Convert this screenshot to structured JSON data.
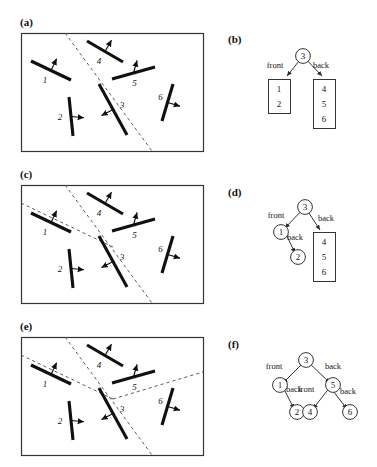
{
  "figure": {
    "type": "bsp-tree-construction-diagram",
    "panels": [
      {
        "id": "a",
        "label": "(a)",
        "kind": "scene",
        "x": 20,
        "y": 16
      },
      {
        "id": "b",
        "label": "(b)",
        "kind": "tree",
        "x": 228,
        "y": 33
      },
      {
        "id": "c",
        "label": "(c)",
        "kind": "scene",
        "x": 20,
        "y": 168
      },
      {
        "id": "d",
        "label": "(d)",
        "kind": "tree",
        "x": 228,
        "y": 186
      },
      {
        "id": "e",
        "label": "(e)",
        "kind": "scene",
        "x": 20,
        "y": 320
      },
      {
        "id": "f",
        "label": "(f)",
        "kind": "tree",
        "x": 228,
        "y": 338
      }
    ]
  },
  "scene": {
    "segment_labels": [
      "1",
      "2",
      "3",
      "4",
      "5",
      "6"
    ],
    "segments": [
      {
        "label": "1",
        "x1": 31,
        "y1": 61,
        "x2": 71,
        "y2": 80,
        "nx": 0.43,
        "ny": -0.9,
        "label_dx": -6,
        "label_dy": 12
      },
      {
        "label": "2",
        "x1": 69,
        "y1": 97,
        "x2": 73,
        "y2": 136,
        "nx": 0.99,
        "ny": 0.1,
        "label_dx": -11,
        "label_dy": 3
      },
      {
        "label": "3",
        "x1": 99,
        "y1": 84,
        "x2": 127,
        "y2": 135,
        "nx": -0.88,
        "ny": 0.47,
        "label_dx": 9,
        "label_dy": -2
      },
      {
        "label": "4",
        "x1": 87,
        "y1": 41,
        "x2": 123,
        "y2": 62,
        "nx": 0.5,
        "ny": -0.86,
        "label_dx": -6,
        "label_dy": 12
      },
      {
        "label": "5",
        "x1": 112,
        "y1": 79,
        "x2": 155,
        "y2": 67,
        "nx": 0.27,
        "ny": -0.96,
        "label_dx": 1,
        "label_dy": 13
      },
      {
        "label": "6",
        "x1": 173,
        "y1": 84,
        "x2": 162,
        "y2": 121,
        "nx": 0.96,
        "ny": 0.28,
        "label_dx": -7,
        "label_dy": -3
      }
    ],
    "box": {
      "x": 21,
      "y": 33,
      "w": 182,
      "h": 118
    },
    "splits": {
      "a": [
        "3"
      ],
      "c": [
        "3",
        "1"
      ],
      "e": [
        "3",
        "1",
        "5"
      ]
    },
    "dashed_lines": {
      "a": [
        {
          "x1": 65,
          "y1": 33,
          "x2": 152,
          "y2": 151
        }
      ],
      "c": [
        {
          "x1": 65,
          "y1": 33,
          "x2": 152,
          "y2": 151
        },
        {
          "x1": 21,
          "y1": 51,
          "x2": 113,
          "y2": 95
        }
      ],
      "e": [
        {
          "x1": 65,
          "y1": 33,
          "x2": 152,
          "y2": 151
        },
        {
          "x1": 21,
          "y1": 51,
          "x2": 113,
          "y2": 95
        },
        {
          "x1": 113,
          "y1": 95,
          "x2": 203,
          "y2": 68
        }
      ]
    }
  },
  "trees": {
    "b": {
      "root": {
        "value": "3",
        "cx": 303,
        "cy": 56,
        "shape": "circle"
      },
      "edges": [
        {
          "label": "front",
          "lx": 275,
          "ly": 68,
          "from": [
            303,
            56
          ],
          "to": [
            287,
            76
          ]
        },
        {
          "label": "back",
          "lx": 321,
          "ly": 68,
          "from": [
            303,
            56
          ],
          "to": [
            322,
            76
          ]
        }
      ],
      "lists": [
        {
          "values": [
            "1",
            "2"
          ],
          "x": 268,
          "y": 79,
          "w": 22,
          "h": 34
        },
        {
          "values": [
            "4",
            "5",
            "6"
          ],
          "x": 313,
          "y": 79,
          "w": 22,
          "h": 49
        }
      ],
      "circles": []
    },
    "d": {
      "root": {
        "value": "3",
        "cx": 305,
        "cy": 207,
        "shape": "circle"
      },
      "edges": [
        {
          "label": "front",
          "lx": 276,
          "ly": 218,
          "from": [
            305,
            207
          ],
          "to": [
            285,
            228
          ]
        },
        {
          "label": "back",
          "lx": 326,
          "ly": 221,
          "from": [
            305,
            207
          ],
          "to": [
            320,
            230
          ]
        },
        {
          "label": "back",
          "lx": 295,
          "ly": 240,
          "from": [
            285,
            232
          ],
          "to": [
            295,
            253
          ]
        }
      ],
      "circles": [
        {
          "value": "1",
          "cx": 281,
          "cy": 232
        },
        {
          "value": "2",
          "cx": 298,
          "cy": 257
        }
      ],
      "lists": [
        {
          "values": [
            "4",
            "5",
            "6"
          ],
          "x": 313,
          "y": 232,
          "w": 22,
          "h": 49
        }
      ]
    },
    "f": {
      "root": {
        "value": "3",
        "cx": 306,
        "cy": 360,
        "shape": "circle"
      },
      "edges": [
        {
          "label": "front",
          "lx": 274,
          "ly": 369,
          "from": [
            306,
            360
          ],
          "to": [
            283,
            383
          ]
        },
        {
          "label": "back",
          "lx": 333,
          "ly": 369,
          "from": [
            306,
            360
          ],
          "to": [
            330,
            383
          ]
        },
        {
          "label": "back",
          "lx": 294,
          "ly": 392,
          "from": [
            283,
            387
          ],
          "to": [
            294,
            409
          ]
        },
        {
          "label": "front",
          "lx": 306,
          "ly": 392,
          "from": [
            330,
            387
          ],
          "to": [
            313,
            409
          ]
        },
        {
          "label": "back",
          "lx": 348,
          "ly": 394,
          "from": [
            330,
            387
          ],
          "to": [
            347,
            409
          ]
        }
      ],
      "circles": [
        {
          "value": "1",
          "cx": 280,
          "cy": 385
        },
        {
          "value": "5",
          "cx": 333,
          "cy": 385
        },
        {
          "value": "2",
          "cx": 297,
          "cy": 412
        },
        {
          "value": "4",
          "cx": 310,
          "cy": 412
        },
        {
          "value": "6",
          "cx": 350,
          "cy": 412
        }
      ],
      "lists": []
    }
  },
  "style": {
    "segment_color": "#101010",
    "box_border_color": "#333333",
    "dash_color": "#4a4a4a",
    "node_stroke": "#2a2a2a",
    "text_color": "#141414"
  }
}
